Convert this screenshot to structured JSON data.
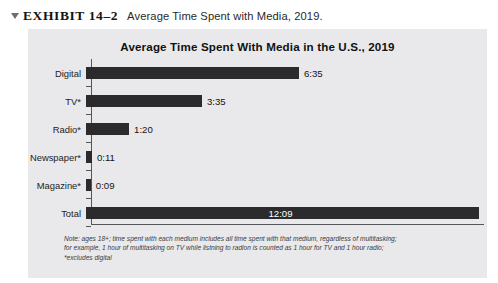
{
  "exhibit": {
    "marker_icon": "triangle-down-icon",
    "label": "EXHIBIT 14–2",
    "caption": "Average Time Spent with Media, 2019."
  },
  "chart_title": "Average Time Spent With Media in the U.S., 2019",
  "footnote": {
    "line1": "Note: ages 18+; time spent with each medium includes all time spent with that medium, regardless of multitasking;",
    "line2": "for example, 1 hour of multitasking on TV while listning to radion is counted as 1 hour for TV and 1 hour radio;",
    "line3": "*excludes digital"
  },
  "colors": {
    "panel_background": "#e9e9eb",
    "bar": "#2b2b2d",
    "axis": "#55565a",
    "value_text": "#141414",
    "inside_value_text": "#ffffff"
  },
  "chart_data": {
    "type": "bar",
    "orientation": "horizontal",
    "title": "Average Time Spent With Media in the U.S., 2019",
    "xlabel": "",
    "ylabel": "",
    "grid": false,
    "legend": "none",
    "categories": [
      "Digital",
      "TV*",
      "Radio*",
      "Newspaper*",
      "Magazine*",
      "Total"
    ],
    "labels": [
      "6:35",
      "3:35",
      "1:20",
      "0:11",
      "0:09",
      "12:09"
    ],
    "values": [
      6.583,
      3.583,
      1.333,
      0.183,
      0.15,
      12.15
    ],
    "units": "hours:minutes per day",
    "xlim": [
      0,
      12.15
    ],
    "value_label_position": [
      "outside",
      "outside",
      "outside",
      "outside",
      "outside",
      "inside"
    ]
  }
}
